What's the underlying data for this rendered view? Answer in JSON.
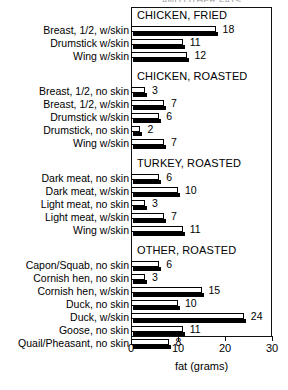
{
  "figure": {
    "clipped_top_title": "AND OTHER FATS",
    "axis_title": "fat (grams)",
    "tick_labels": [
      "0",
      "10",
      "20",
      "30"
    ],
    "ink_color": "#000000"
  },
  "chart_data": {
    "type": "bar",
    "orientation": "horizontal",
    "title": "",
    "xlabel": "fat (grams)",
    "ylabel": "",
    "xlim": [
      0,
      30
    ],
    "xticks": [
      0,
      10,
      20,
      30
    ],
    "grid": false,
    "legend": "none",
    "units": "grams of fat",
    "groups": [
      {
        "name": "CHICKEN, FRIED",
        "items": [
          {
            "label": "Breast, 1/2, w/skin",
            "value": 18
          },
          {
            "label": "Drumstick w/skin",
            "value": 11
          },
          {
            "label": "Wing w/skin",
            "value": 12
          }
        ]
      },
      {
        "name": "CHICKEN, ROASTED",
        "items": [
          {
            "label": "Breast, 1/2, no skin",
            "value": 3
          },
          {
            "label": "Breast, 1/2, w/skin",
            "value": 7
          },
          {
            "label": "Drumstick w/skin",
            "value": 6
          },
          {
            "label": "Drumstick, no skin",
            "value": 2
          },
          {
            "label": "Wing w/skin",
            "value": 7
          }
        ]
      },
      {
        "name": "TURKEY, ROASTED",
        "items": [
          {
            "label": "Dark meat, no skin",
            "value": 6
          },
          {
            "label": "Dark meat, w/skin",
            "value": 10
          },
          {
            "label": "Light meat, no skin",
            "value": 3
          },
          {
            "label": "Light meat, w/skin",
            "value": 7
          },
          {
            "label": "Wing w/skin",
            "value": 11
          }
        ]
      },
      {
        "name": "OTHER, ROASTED",
        "items": [
          {
            "label": "Capon/Squab, no skin",
            "value": 6
          },
          {
            "label": "Cornish hen, no skin",
            "value": 3
          },
          {
            "label": "Cornish hen, w/skin",
            "value": 15
          },
          {
            "label": "Duck, no skin",
            "value": 10
          },
          {
            "label": "Duck, w/skin",
            "value": 24
          },
          {
            "label": "Goose, no skin",
            "value": 11
          },
          {
            "label": "Quail/Pheasant, no skin",
            "value": 8
          }
        ]
      }
    ]
  }
}
